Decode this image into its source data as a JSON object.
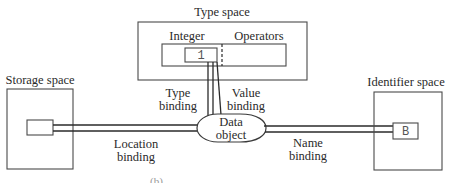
{
  "diagram": {
    "type_space": {
      "title": "Type space",
      "integer_label": "Integer",
      "operators_label": "Operators",
      "value": "1"
    },
    "storage_space": {
      "title": "Storage space"
    },
    "identifier_space": {
      "title": "Identifier space",
      "identifier": "B"
    },
    "data_object": {
      "line1": "Data",
      "line2": "object"
    },
    "bindings": {
      "type": {
        "line1": "Type",
        "line2": "binding"
      },
      "value": {
        "line1": "Value",
        "line2": "binding"
      },
      "location": {
        "line1": "Location",
        "line2": "binding"
      },
      "name": {
        "line1": "Name",
        "line2": "binding"
      }
    },
    "caption_fragment": "(b) ..."
  }
}
